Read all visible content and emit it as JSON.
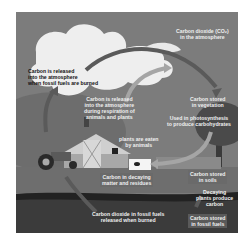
{
  "diagram": {
    "labels": {
      "fossil_release": [
        "Carbon is released",
        "into the atmosphere",
        "when fossil fuels are burned"
      ],
      "co2_atmosphere": [
        "Carbon dioxide (CO₂)",
        "in the atmosphere"
      ],
      "respiration": [
        "Carbon is released",
        "into the atmosphere",
        "during respiration of",
        "animals and plants"
      ],
      "vegetation": [
        "Carbon stored",
        "in vegetation"
      ],
      "photosynthesis": [
        "Used in photosynthesis",
        "to produce carbohydrates"
      ],
      "eaten": [
        "plants are eaten",
        "by animals"
      ],
      "decaying_matter": [
        "Carbon in decaying",
        "matter and residues"
      ],
      "soil": [
        "Carbon stored",
        "in soils"
      ],
      "decaying_plants": [
        "Decaying",
        "plants produce",
        "carbon"
      ],
      "fossil_co2": [
        "Carbon dioxide in fossil fuels",
        "released when burned"
      ],
      "fossil_stored": [
        "Carbon stored",
        "in fossil fuels"
      ]
    },
    "scene": [
      "cloud",
      "sky",
      "barn",
      "tractor",
      "cow",
      "tree",
      "crops",
      "soil-layer",
      "fossil-layer"
    ],
    "colors": {
      "sky": "#7a7a7a",
      "cloud": "#f2f2f2",
      "ground": "#6e6e6e",
      "fossil": "#1e1e1e",
      "arrow": "#555555",
      "arrow_light": "#a9a9a9"
    }
  }
}
